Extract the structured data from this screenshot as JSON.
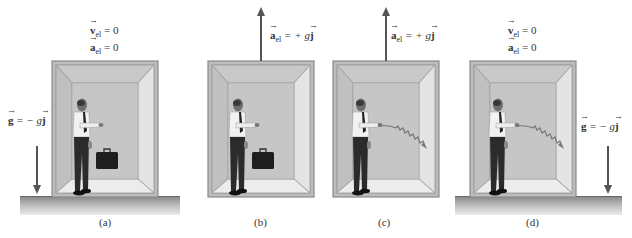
{
  "panels": [
    {
      "id": "a",
      "caption": "(a)",
      "labels": {
        "v_sym": "v",
        "v_sub": "el",
        "v_rhs": " = 0",
        "a_sym": "a",
        "a_sub": "el",
        "a_rhs": " = 0"
      },
      "gravity": {
        "sym": "g",
        "rhs": " = − g",
        "unit": "j"
      },
      "object": "briefcase",
      "has_floor": true
    },
    {
      "id": "b",
      "caption": "(b)",
      "labels": {
        "a_sym": "a",
        "a_sub": "el",
        "a_rhs": " = + g",
        "unit": "j"
      },
      "object": "briefcase",
      "has_floor": false
    },
    {
      "id": "c",
      "caption": "(c)",
      "labels": {
        "a_sym": "a",
        "a_sub": "el",
        "a_rhs": " = + g",
        "unit": "j"
      },
      "object": "laser-beam",
      "has_floor": false
    },
    {
      "id": "d",
      "caption": "(d)",
      "labels": {
        "v_sym": "v",
        "v_sub": "el",
        "v_rhs": " = 0",
        "a_sym": "a",
        "a_sub": "el",
        "a_rhs": " = 0"
      },
      "gravity": {
        "sym": "g",
        "rhs": " = − g",
        "unit": "j"
      },
      "object": "laser-beam",
      "has_floor": true
    }
  ],
  "colors": {
    "box_outer": "#bdbdbd",
    "box_inner": "#c8c8c8",
    "box_edge": "#888888",
    "arrow": "#555555"
  }
}
